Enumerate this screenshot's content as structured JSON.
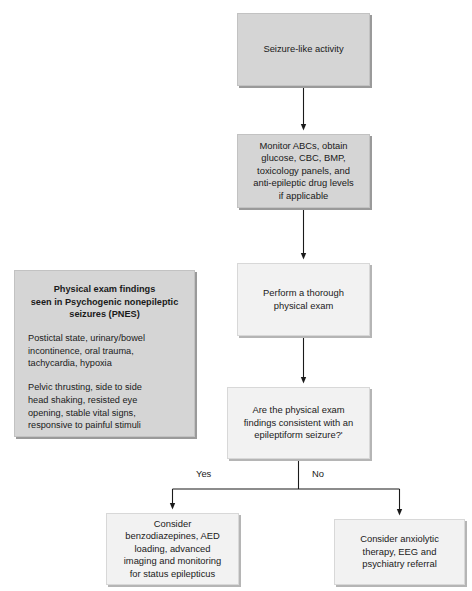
{
  "diagram": {
    "type": "clinical-decision-flowchart",
    "colors": {
      "shaded_node_fill": "#d5d5d5",
      "light_node_fill": "#f2f2f2",
      "border": "#b9b9b9",
      "shadow": "#9a9a9a",
      "text": "#1a1a1a",
      "connector": "#1a1a1a",
      "background": "#ffffff"
    },
    "nodes": [
      {
        "id": "start",
        "label": "Seizure-like activity",
        "style": "shaded"
      },
      {
        "id": "workup",
        "label": "Monitor ABCs, obtain\nglucose, CBC, BMP,\ntoxicology panels, and\nanti-epileptic drug levels\nif applicable",
        "style": "shaded"
      },
      {
        "id": "exam",
        "label": "Perform a thorough\nphysical exam",
        "style": "light"
      },
      {
        "id": "decision",
        "label": "Are the physical exam\nfindings consistent with an\nepileptiform seizure?ʹ",
        "style": "light"
      },
      {
        "id": "outcome_yes",
        "label": "Consider\nbenzodiazepines, AED\nloading, advanced\nimaging and monitoring\nfor status epilepticus",
        "style": "light"
      },
      {
        "id": "outcome_no",
        "label": "Consider anxiolytic\ntherapy, EEG and\npsychiatry referral",
        "style": "light"
      }
    ],
    "branches": {
      "yes_label": "Yes",
      "no_label": "No"
    },
    "side_panel": {
      "id": "pnes",
      "title": "Physical exam findings\nseen in Psychogenic nonepileptic\nseizures (PNES)",
      "paragraphs": [
        "Postictal state, urinary/bowel\nincontinence, oral trauma,\ntachycardia, hypoxia",
        "Pelvic thrusting, side to side\nhead shaking, resisted eye\nopening, stable vital signs,\nresponsive to painful stimuli"
      ]
    },
    "edges": [
      {
        "from": "start",
        "to": "workup",
        "label": ""
      },
      {
        "from": "workup",
        "to": "exam",
        "label": ""
      },
      {
        "from": "exam",
        "to": "decision",
        "label": ""
      },
      {
        "from": "decision",
        "to": "outcome_yes",
        "label": "Yes"
      },
      {
        "from": "decision",
        "to": "outcome_no",
        "label": "No"
      }
    ]
  }
}
